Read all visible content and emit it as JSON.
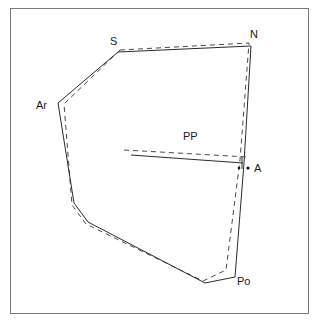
{
  "figure": {
    "frame": {
      "x": 10,
      "y": 8,
      "width": 299,
      "height": 306,
      "border_color": "#7a7a7a",
      "background_color": "#ffffff"
    },
    "colors": {
      "solid_trace": "#2b2b2b",
      "dashed_trace": "#4a4a4a",
      "point_marker": "#111111",
      "label_text": "#1a1a1a"
    }
  },
  "labels": [
    {
      "id": "S",
      "text": "S",
      "x": 110,
      "y": 36,
      "point_x": 118,
      "point_y": 52
    },
    {
      "id": "N",
      "text": "N",
      "x": 250,
      "y": 29,
      "point_x": 251,
      "point_y": 46
    },
    {
      "id": "Ar",
      "text": "Ar",
      "x": 36,
      "y": 100,
      "point_x": 58,
      "point_y": 103
    },
    {
      "id": "PP",
      "text": "PP",
      "x": 183,
      "y": 131,
      "point_x": 190,
      "point_y": 150
    },
    {
      "id": "A",
      "text": "A",
      "x": 254,
      "y": 163,
      "point_x": 248,
      "point_y": 168
    },
    {
      "id": "Po",
      "text": "Po",
      "x": 237,
      "y": 276,
      "point_x": 235,
      "point_y": 277
    }
  ],
  "chart_data": {
    "type": "line",
    "xlabel": "",
    "ylabel": "",
    "xlim": [
      10,
      309
    ],
    "ylim": [
      8,
      314
    ],
    "grid": false,
    "legend": "none",
    "annotations": [
      "S",
      "N",
      "Ar",
      "PP",
      "A",
      "Po"
    ],
    "series": [
      {
        "name": "solid-trace-outline",
        "style": "solid",
        "color": "#2b2b2b",
        "closed": true,
        "points": [
          [
            118,
            52
          ],
          [
            251,
            46
          ],
          [
            244,
            163
          ],
          [
            235,
            277
          ],
          [
            205,
            283
          ],
          [
            88,
            222
          ],
          [
            74,
            203
          ],
          [
            58,
            103
          ]
        ]
      },
      {
        "name": "dashed-trace-outline",
        "style": "dashed",
        "color": "#4a4a4a",
        "closed": true,
        "points": [
          [
            120,
            50
          ],
          [
            249,
            43
          ],
          [
            240,
            160
          ],
          [
            226,
            270
          ],
          [
            203,
            281
          ],
          [
            86,
            224
          ],
          [
            72,
            205
          ],
          [
            64,
            104
          ]
        ]
      },
      {
        "name": "palatal-plane-solid",
        "style": "solid",
        "color": "#2b2b2b",
        "closed": false,
        "points": [
          [
            131,
            155
          ],
          [
            243,
            163
          ]
        ]
      },
      {
        "name": "palatal-plane-dashed",
        "style": "dashed",
        "color": "#4a4a4a",
        "closed": false,
        "points": [
          [
            124,
            150
          ],
          [
            248,
            157
          ]
        ]
      }
    ],
    "markers": [
      {
        "name": "point-A-marker",
        "x": 248,
        "y": 168,
        "r": 1.6
      },
      {
        "name": "point-A-aux-marker",
        "x": 239,
        "y": 168,
        "r": 1.3
      }
    ],
    "ticks": [
      {
        "name": "pp-endpoint-tick",
        "x1": 242,
        "y1": 157,
        "x2": 242,
        "y2": 169
      }
    ]
  }
}
